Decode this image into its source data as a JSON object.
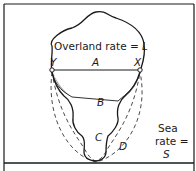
{
  "diagram": {
    "overland_label": "Overland rate =",
    "overland_var": "L",
    "points": {
      "left": "Y",
      "right": "X"
    },
    "routes": [
      "A",
      "B",
      "C",
      "D"
    ],
    "sea_label_line1": "Sea",
    "sea_label_line2": "rate =",
    "sea_var": "S"
  },
  "colors": {
    "ink": "#1a1a1a",
    "background": "#ffffff"
  }
}
